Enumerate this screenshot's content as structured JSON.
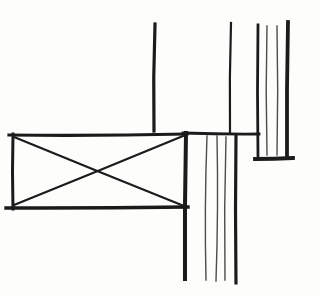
{
  "drawing": {
    "canvas": {
      "width": 320,
      "height": 296,
      "background": "#fdfdfc",
      "ink": "#1b1b1b",
      "thin_ink": "#4d4d4d"
    },
    "groups": [
      {
        "name": "upper-left-wall-line",
        "lines": [
          {
            "p": [
              155,
              24,
              154,
              131
            ],
            "w": 3.2,
            "bend": 1.5
          }
        ]
      },
      {
        "name": "upper-middle-wall-line",
        "lines": [
          {
            "p": [
              231,
              23,
              230,
              132
            ],
            "w": 2.2,
            "bend": 1.2
          }
        ]
      },
      {
        "name": "ledge-line",
        "lines": [
          {
            "p": [
              183,
              133,
              259,
              134
            ],
            "w": 2.8,
            "bend": 0.8
          }
        ]
      },
      {
        "name": "crossed-blocking-box",
        "lines": [
          {
            "p": [
              9,
              135,
              187,
              134
            ],
            "w": 3.2,
            "bend": 1.4
          },
          {
            "p": [
              13,
              134,
              13,
              209
            ],
            "w": 3.0,
            "bend": 1.0
          },
          {
            "p": [
              6,
              208,
              188,
              207
            ],
            "w": 3.4,
            "bend": 0.8
          },
          {
            "p": [
              186,
              133,
              185,
              279
            ],
            "w": 4.0,
            "bend": 1.0
          }
        ]
      },
      {
        "name": "blocking-cross-diagonals",
        "lines": [
          {
            "p": [
              14,
              137,
              184,
              206
            ],
            "w": 2.2,
            "bend": 0.4
          },
          {
            "p": [
              14,
              205,
              183,
              136
            ],
            "w": 2.2,
            "bend": 0.4
          }
        ]
      },
      {
        "name": "lower-grain-band",
        "lines": [
          {
            "p": [
              207,
              136,
              206,
              280
            ],
            "w": 1.4,
            "bend": 2.2,
            "tone": "thin"
          },
          {
            "p": [
              217,
              136,
              216,
              281
            ],
            "w": 1.4,
            "bend": -2.0,
            "tone": "thin"
          },
          {
            "p": [
              226,
              137,
              225,
              280
            ],
            "w": 1.4,
            "bend": 1.6,
            "tone": "thin"
          },
          {
            "p": [
              236,
              135,
              236,
              283
            ],
            "w": 3.2,
            "bend": 1.0
          }
        ]
      },
      {
        "name": "upper-right-grain-panel",
        "lines": [
          {
            "p": [
              258,
              25,
              258,
              157
            ],
            "w": 2.8,
            "bend": 1.0
          },
          {
            "p": [
              267,
              26,
              267,
              155
            ],
            "w": 1.4,
            "bend": 1.6,
            "tone": "thin"
          },
          {
            "p": [
              277,
              26,
              277,
              155
            ],
            "w": 1.4,
            "bend": -1.4,
            "tone": "thin"
          },
          {
            "p": [
              288,
              22,
              287,
              157
            ],
            "w": 3.8,
            "bend": 1.0
          },
          {
            "p": [
              255,
              159,
              293,
              158
            ],
            "w": 3.8,
            "bend": 0.5
          }
        ]
      }
    ]
  }
}
